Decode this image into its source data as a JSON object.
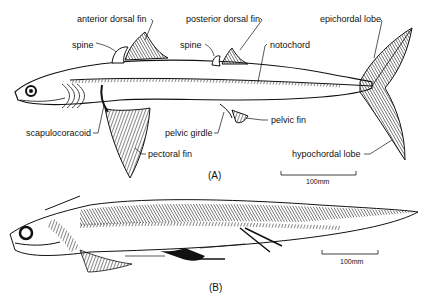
{
  "figure": {
    "panel_a": {
      "tag": "(A)",
      "labels": {
        "anterior_dorsal_fin": "anterior dorsal fin",
        "posterior_dorsal_fin": "posterior dorsal fin",
        "epichordal_lobe": "epichordal lobe",
        "spine_anterior": "spine",
        "spine_posterior": "spine",
        "notochord": "notochord",
        "scapulocoracoid": "scapulocoracoid",
        "pelvic_girdle": "pelvic girdle",
        "pelvic_fin": "pelvic fin",
        "pectoral_fin": "pectoral fin",
        "hypochordal_lobe": "hypochordal lobe"
      },
      "scale_bar": "100mm"
    },
    "panel_b": {
      "tag": "(B)",
      "scale_bar": "100mm"
    }
  }
}
